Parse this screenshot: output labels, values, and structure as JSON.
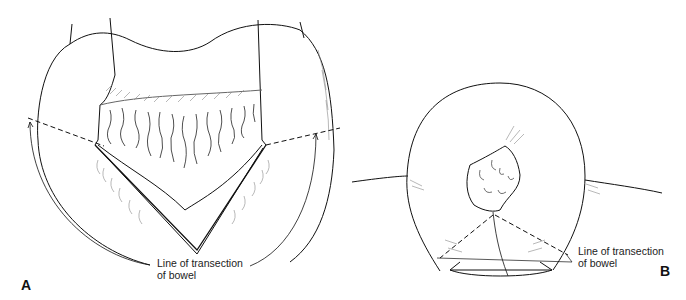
{
  "figure": {
    "panels": [
      {
        "id": "A",
        "label": "A",
        "annotation_line1": "Line of transection",
        "annotation_line2": "of bowel"
      },
      {
        "id": "B",
        "label": "B",
        "annotation_line1": "Line of transection",
        "annotation_line2": "of bowel"
      }
    ],
    "colors": {
      "line": "#111111",
      "hatch": "#888888",
      "background": "#ffffff"
    }
  }
}
